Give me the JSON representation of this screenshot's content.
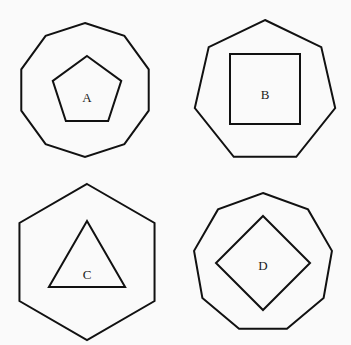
{
  "figure": {
    "background_color": "#fafafa",
    "stroke_color": "#111111",
    "label_color": "#1a1a1a",
    "width": 351,
    "height": 345,
    "layout": "2x2 grid of nested polygon panels"
  },
  "panels": [
    {
      "id": "A",
      "label": "A",
      "position": "top-left",
      "outer_shape": {
        "name": "decagon",
        "sides": 10,
        "orientation": "vertex-top",
        "center_x": 85,
        "center_y": 90,
        "radius": 67
      },
      "inner_shape": {
        "name": "pentagon",
        "sides": 5,
        "orientation": "vertex-top",
        "center_x": 87,
        "center_y": 92,
        "radius": 36
      },
      "label_x": 87,
      "label_y": 99
    },
    {
      "id": "B",
      "label": "B",
      "position": "top-right",
      "outer_shape": {
        "name": "heptagon",
        "sides": 7,
        "orientation": "vertex-top",
        "center_x": 89,
        "center_y": 92,
        "radius": 72
      },
      "inner_shape": {
        "name": "square",
        "sides": 4,
        "orientation": "axis-aligned",
        "center_x": 89,
        "center_y": 89,
        "half_size": 35
      },
      "label_x": 89,
      "label_y": 96
    },
    {
      "id": "C",
      "label": "C",
      "position": "bottom-left",
      "outer_shape": {
        "name": "hexagon",
        "sides": 6,
        "orientation": "vertex-top",
        "center_x": 87,
        "center_y": 89,
        "radius": 78
      },
      "inner_shape": {
        "name": "triangle",
        "sides": 3,
        "orientation": "vertex-top",
        "center_x": 87,
        "center_y": 92,
        "radius": 44
      },
      "label_x": 87,
      "label_y": 103
    },
    {
      "id": "D",
      "label": "D",
      "position": "bottom-right",
      "outer_shape": {
        "name": "nonagon",
        "sides": 9,
        "orientation": "vertex-top",
        "center_x": 87,
        "center_y": 90,
        "radius": 70
      },
      "inner_shape": {
        "name": "diamond",
        "sides": 4,
        "orientation": "rotated-45",
        "center_x": 87,
        "center_y": 90,
        "radius": 47
      },
      "label_x": 87,
      "label_y": 94
    }
  ]
}
